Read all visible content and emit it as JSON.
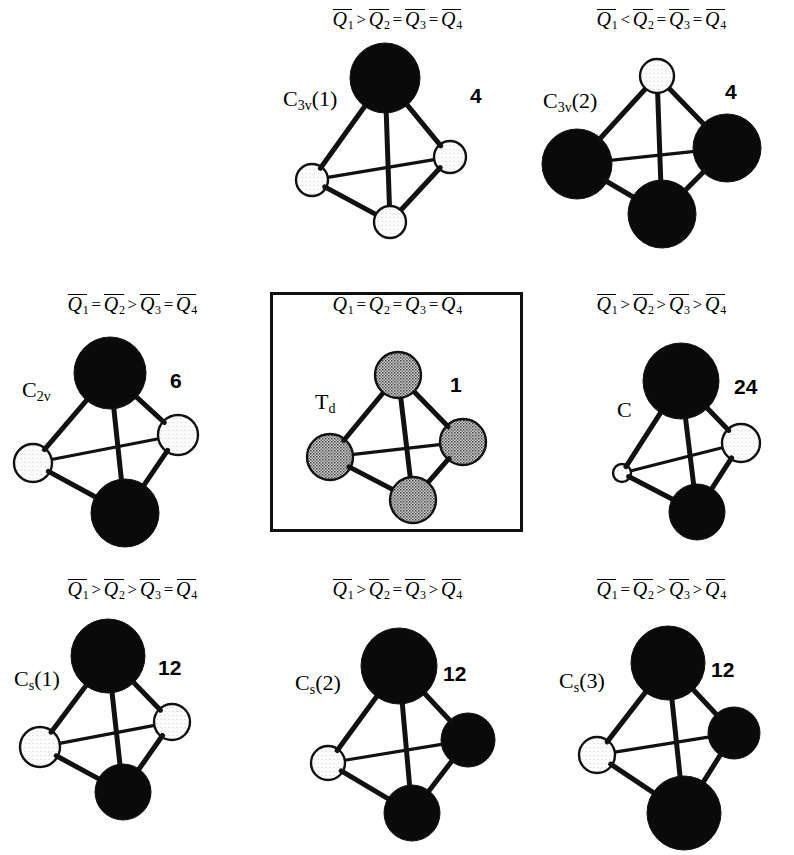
{
  "figure": {
    "background_color": "#ffffff",
    "ink_color": "#000000"
  },
  "legend_symbols": {
    "q": "Q",
    "greater": ">",
    "less": "<",
    "equal": "=",
    "overbar": "macron"
  },
  "panels": [
    {
      "id": "c3v1",
      "grid": {
        "row": 0,
        "col": 1
      },
      "boxed": false,
      "formula": {
        "terms": [
          "Q",
          "Q",
          "Q",
          "Q"
        ],
        "subscripts": [
          "1",
          "2",
          "3",
          "4"
        ],
        "operators": [
          ">",
          "=",
          "="
        ],
        "text": "Q1 > Q2 = Q3 = Q4"
      },
      "symmetry_label": {
        "main": "C",
        "sub": "3v",
        "suffix": "(1)"
      },
      "count": "4",
      "label_pos": {
        "x": 18,
        "y": 86
      },
      "count_pos": {
        "x": 205,
        "y": 84
      },
      "vertices": [
        {
          "name": "apex",
          "x": 120,
          "y": 78,
          "r": 35,
          "fill": "black"
        },
        {
          "name": "left",
          "x": 47,
          "y": 180,
          "r": 16,
          "fill": "white"
        },
        {
          "name": "right",
          "x": 185,
          "y": 157,
          "r": 16,
          "fill": "white"
        },
        {
          "name": "bottom-front",
          "x": 125,
          "y": 222,
          "r": 16,
          "fill": "white"
        }
      ]
    },
    {
      "id": "c3v2",
      "grid": {
        "row": 0,
        "col": 2
      },
      "boxed": false,
      "formula": {
        "terms": [
          "Q",
          "Q",
          "Q",
          "Q"
        ],
        "subscripts": [
          "1",
          "2",
          "3",
          "4"
        ],
        "operators": [
          "<",
          "=",
          "="
        ],
        "text": "Q1 < Q2 = Q3 = Q4"
      },
      "symmetry_label": {
        "main": "C",
        "sub": "3v",
        "suffix": "(2)"
      },
      "count": "4",
      "label_pos": {
        "x": 14,
        "y": 88
      },
      "count_pos": {
        "x": 196,
        "y": 80
      },
      "vertices": [
        {
          "name": "apex",
          "x": 128,
          "y": 76,
          "r": 17,
          "fill": "white"
        },
        {
          "name": "left",
          "x": 48,
          "y": 164,
          "r": 35,
          "fill": "black"
        },
        {
          "name": "right",
          "x": 198,
          "y": 148,
          "r": 34,
          "fill": "black"
        },
        {
          "name": "bottom-front",
          "x": 133,
          "y": 214,
          "r": 34,
          "fill": "black"
        }
      ]
    },
    {
      "id": "c2v",
      "grid": {
        "row": 1,
        "col": 0
      },
      "boxed": false,
      "formula": {
        "terms": [
          "Q",
          "Q",
          "Q",
          "Q"
        ],
        "subscripts": [
          "1",
          "2",
          "3",
          "4"
        ],
        "operators": [
          "=",
          ">",
          "="
        ],
        "text": "Q1 = Q2 > Q3 = Q4"
      },
      "symmetry_label": {
        "main": "C",
        "sub": "2v",
        "suffix": ""
      },
      "count": "6",
      "label_pos": {
        "x": 22,
        "y": 92
      },
      "count_pos": {
        "x": 170,
        "y": 84
      },
      "vertices": [
        {
          "name": "apex",
          "x": 110,
          "y": 88,
          "r": 36,
          "fill": "black"
        },
        {
          "name": "left",
          "x": 33,
          "y": 178,
          "r": 19,
          "fill": "white"
        },
        {
          "name": "right",
          "x": 178,
          "y": 150,
          "r": 20,
          "fill": "white"
        },
        {
          "name": "bottom-front",
          "x": 125,
          "y": 228,
          "r": 34,
          "fill": "black"
        }
      ]
    },
    {
      "id": "td",
      "grid": {
        "row": 1,
        "col": 1
      },
      "boxed": true,
      "box": {
        "x": 5,
        "y": 7,
        "width": 253,
        "height": 240
      },
      "formula": {
        "terms": [
          "Q",
          "Q",
          "Q",
          "Q"
        ],
        "subscripts": [
          "1",
          "2",
          "3",
          "4"
        ],
        "operators": [
          "=",
          "=",
          "="
        ],
        "text": "Q1 = Q2 = Q3 = Q4"
      },
      "symmetry_label": {
        "main": "T",
        "sub": "d",
        "suffix": ""
      },
      "count": "1",
      "label_pos": {
        "x": 50,
        "y": 104
      },
      "count_pos": {
        "x": 185,
        "y": 88
      },
      "vertices": [
        {
          "name": "apex",
          "x": 133,
          "y": 90,
          "r": 23,
          "fill": "gray"
        },
        {
          "name": "left",
          "x": 65,
          "y": 172,
          "r": 23,
          "fill": "gray"
        },
        {
          "name": "right",
          "x": 198,
          "y": 157,
          "r": 23,
          "fill": "gray"
        },
        {
          "name": "bottom-front",
          "x": 148,
          "y": 215,
          "r": 23,
          "fill": "gray"
        }
      ]
    },
    {
      "id": "c",
      "grid": {
        "row": 1,
        "col": 2
      },
      "boxed": false,
      "formula": {
        "terms": [
          "Q",
          "Q",
          "Q",
          "Q"
        ],
        "subscripts": [
          "1",
          "2",
          "3",
          "4"
        ],
        "operators": [
          ">",
          ">",
          ">"
        ],
        "text": "Q1 > Q2 > Q3 > Q4"
      },
      "symmetry_label": {
        "main": "C",
        "sub": "",
        "suffix": ""
      },
      "count": "24",
      "label_pos": {
        "x": 88,
        "y": 112
      },
      "count_pos": {
        "x": 205,
        "y": 90
      },
      "vertices": [
        {
          "name": "apex",
          "x": 152,
          "y": 96,
          "r": 38,
          "fill": "black"
        },
        {
          "name": "left",
          "x": 93,
          "y": 188,
          "r": 9,
          "fill": "white"
        },
        {
          "name": "right",
          "x": 212,
          "y": 158,
          "r": 19,
          "fill": "white"
        },
        {
          "name": "bottom-front",
          "x": 168,
          "y": 227,
          "r": 28,
          "fill": "black"
        }
      ]
    },
    {
      "id": "cs1",
      "grid": {
        "row": 2,
        "col": 0
      },
      "boxed": false,
      "formula": {
        "terms": [
          "Q",
          "Q",
          "Q",
          "Q"
        ],
        "subscripts": [
          "1",
          "2",
          "3",
          "4"
        ],
        "operators": [
          ">",
          ">",
          "="
        ],
        "text": "Q1 > Q2 > Q3 = Q4"
      },
      "symmetry_label": {
        "main": "C",
        "sub": "s",
        "suffix": "(1)"
      },
      "count": "12",
      "label_pos": {
        "x": 14,
        "y": 96
      },
      "count_pos": {
        "x": 158,
        "y": 86
      },
      "vertices": [
        {
          "name": "apex",
          "x": 108,
          "y": 86,
          "r": 37,
          "fill": "black"
        },
        {
          "name": "left",
          "x": 40,
          "y": 177,
          "r": 20,
          "fill": "white"
        },
        {
          "name": "right",
          "x": 172,
          "y": 152,
          "r": 18,
          "fill": "white"
        },
        {
          "name": "bottom-front",
          "x": 123,
          "y": 222,
          "r": 28,
          "fill": "black"
        }
      ]
    },
    {
      "id": "cs2",
      "grid": {
        "row": 2,
        "col": 1
      },
      "boxed": false,
      "formula": {
        "terms": [
          "Q",
          "Q",
          "Q",
          "Q"
        ],
        "subscripts": [
          "1",
          "2",
          "3",
          "4"
        ],
        "operators": [
          ">",
          "=",
          ">"
        ],
        "text": "Q1 > Q2 = Q3 > Q4"
      },
      "symmetry_label": {
        "main": "C",
        "sub": "s",
        "suffix": "(2)"
      },
      "count": "12",
      "label_pos": {
        "x": 30,
        "y": 100
      },
      "count_pos": {
        "x": 178,
        "y": 92
      },
      "vertices": [
        {
          "name": "apex",
          "x": 134,
          "y": 96,
          "r": 38,
          "fill": "black"
        },
        {
          "name": "left",
          "x": 63,
          "y": 193,
          "r": 17,
          "fill": "white"
        },
        {
          "name": "right",
          "x": 203,
          "y": 170,
          "r": 27,
          "fill": "black"
        },
        {
          "name": "bottom-front",
          "x": 147,
          "y": 243,
          "r": 28,
          "fill": "black"
        }
      ]
    },
    {
      "id": "cs3",
      "grid": {
        "row": 2,
        "col": 2
      },
      "boxed": false,
      "formula": {
        "terms": [
          "Q",
          "Q",
          "Q",
          "Q"
        ],
        "subscripts": [
          "1",
          "2",
          "3",
          "4"
        ],
        "operators": [
          "=",
          ">",
          ">"
        ],
        "text": "Q1 = Q2 > Q3 > Q4"
      },
      "symmetry_label": {
        "main": "C",
        "sub": "s",
        "suffix": "(3)"
      },
      "count": "12",
      "label_pos": {
        "x": 30,
        "y": 98
      },
      "count_pos": {
        "x": 182,
        "y": 88
      },
      "vertices": [
        {
          "name": "apex",
          "x": 139,
          "y": 93,
          "r": 37,
          "fill": "black"
        },
        {
          "name": "left",
          "x": 68,
          "y": 185,
          "r": 18,
          "fill": "white"
        },
        {
          "name": "right",
          "x": 205,
          "y": 163,
          "r": 26,
          "fill": "black"
        },
        {
          "name": "bottom-front",
          "x": 155,
          "y": 243,
          "r": 37,
          "fill": "black"
        }
      ]
    }
  ],
  "panel_layout": {
    "col_x": [
      0,
      265,
      529
    ],
    "row_y": [
      0,
      285,
      570
    ],
    "panel_width": 265,
    "panel_height": 285
  },
  "bond_style": {
    "color": "#111111",
    "width_front": 5,
    "width_back": 3.2
  },
  "sphere_colors": {
    "black": "#0a0a0a",
    "white": "#ffffff",
    "gray": "#9a9a9a",
    "outline": "#111111"
  }
}
